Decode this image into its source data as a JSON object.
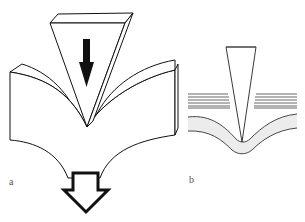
{
  "figure": {
    "panels": [
      {
        "id": "a",
        "label": "a",
        "description": "3D wedge indenter pressing into a bent block, with a solid downward arrow on the wedge and a hollow downward arrow below"
      },
      {
        "id": "b",
        "label": "b",
        "description": "Cross-section: wedge tip penetrating between layered lines into a curved shaded band"
      }
    ],
    "colors": {
      "stroke": "#111111",
      "band_fill": "#ececec",
      "stripe": "#555555",
      "background": "#ffffff"
    }
  }
}
